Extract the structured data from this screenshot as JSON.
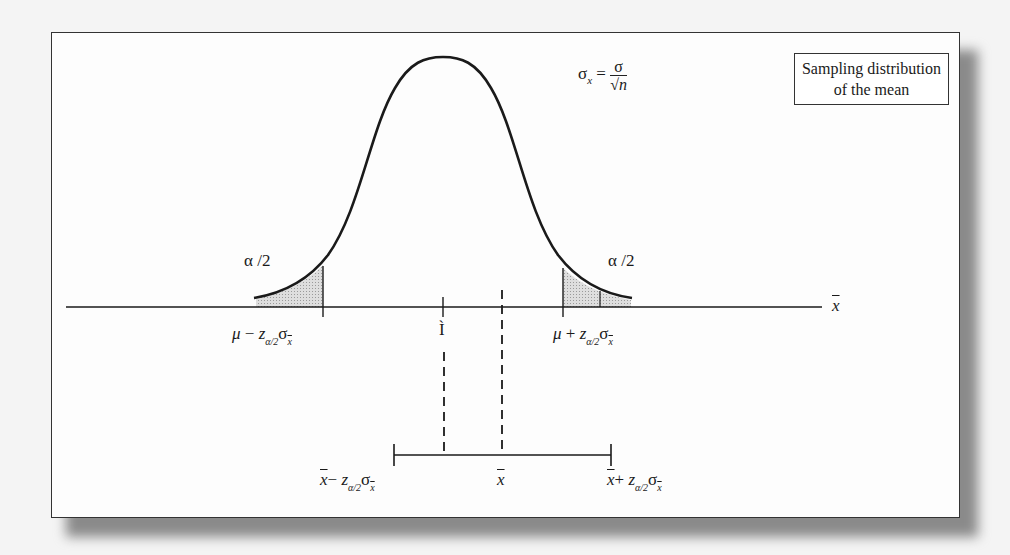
{
  "legend": {
    "line1": "Sampling distribution",
    "line2": "of the mean"
  },
  "formula": {
    "lhs_symbol": "σ",
    "lhs_subscript": "x",
    "equals": "=",
    "numerator": "σ",
    "denominator": "√n"
  },
  "tails": {
    "left_label": "α /2",
    "right_label": "α /2"
  },
  "axis": {
    "label": "x",
    "lower_critical": {
      "mu": "μ",
      "op": "−",
      "z": "z",
      "z_sub": "α/2",
      "sigma": "σ",
      "sigma_sub": "x"
    },
    "upper_critical": {
      "mu": "μ",
      "op": "+",
      "z": "z",
      "z_sub": "α/2",
      "sigma": "σ",
      "sigma_sub": "x"
    },
    "mu_marker": "Ì"
  },
  "interval": {
    "lower": {
      "xbar": "x",
      "op": "−",
      "z": "z",
      "z_sub": "α/2",
      "sigma": "σ",
      "sigma_sub": "x"
    },
    "center": "x",
    "upper": {
      "xbar": "x",
      "op": "+",
      "z": "z",
      "z_sub": "α/2",
      "sigma": "σ",
      "sigma_sub": "x"
    }
  },
  "colors": {
    "line": "#1a1a1a",
    "tail_fill": "#c8c8c8",
    "frame_border": "#333333",
    "background": "#f4f4f4"
  }
}
